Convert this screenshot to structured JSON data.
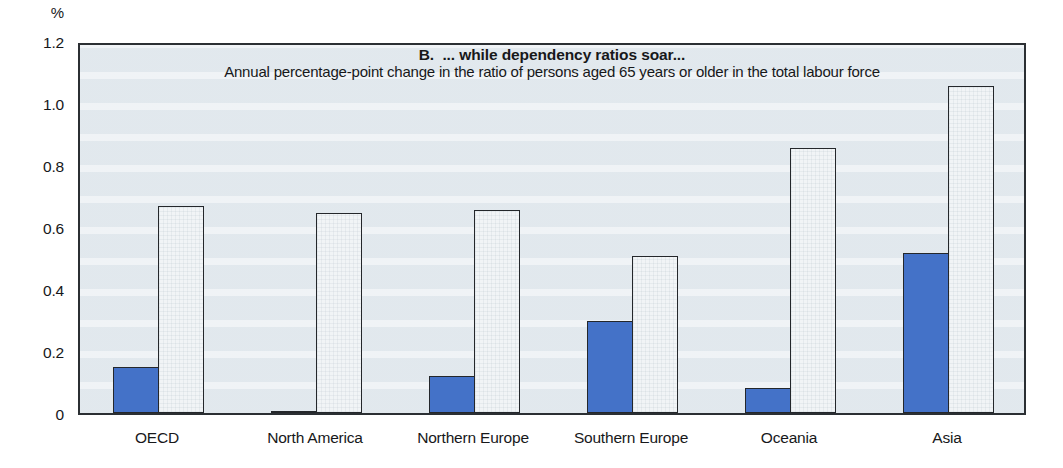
{
  "chart_data": {
    "type": "bar",
    "title": "B.  ... while dependency ratios soar...",
    "subtitle": "Annual percentage-point change in the ratio of persons aged 65 years or older in the total labour force",
    "ylabel_unit": "%",
    "categories": [
      "OECD",
      "North America",
      "Northern Europe",
      "Southern Europe",
      "Oceania",
      "Asia"
    ],
    "series": [
      {
        "name": "dark blue bars",
        "color": "#4472c8",
        "values": [
          0.15,
          0.005,
          0.12,
          0.3,
          0.08,
          0.52
        ]
      },
      {
        "name": "white bars",
        "color": "#f1f4f6",
        "values": [
          0.67,
          0.65,
          0.66,
          0.51,
          0.86,
          1.06
        ]
      }
    ],
    "ylim": [
      0,
      1.2
    ],
    "ytick_labels": [
      "0",
      "0.2",
      "0.4",
      "0.6",
      "0.8",
      "1.0",
      "1.2"
    ],
    "grid": false,
    "legend": "none"
  },
  "colors": {
    "dark_series": "#4472c8",
    "light_series": "#f1f4f6",
    "bar_border": "#24272b",
    "plot_background": "#e9eef2",
    "frame_border": "#2b2f33",
    "text": "#17181a"
  }
}
